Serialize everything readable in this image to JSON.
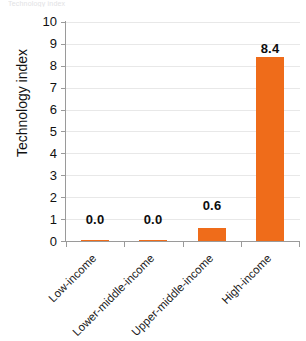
{
  "caption": {
    "text": "Technology index"
  },
  "chart_data": {
    "type": "bar",
    "title": "",
    "xlabel": "",
    "ylabel": "Technology index",
    "categories": [
      "Low-income",
      "Lower-middle-income",
      "Upper-middle-income",
      "High-income"
    ],
    "values": [
      0.0,
      0.0,
      0.6,
      8.4
    ],
    "value_labels": [
      "0.0",
      "0.0",
      "0.6",
      "8.4"
    ],
    "ylim": [
      0,
      10
    ],
    "yticks": [
      0,
      1,
      2,
      3,
      4,
      5,
      6,
      7,
      8,
      9,
      10
    ],
    "ytick_labels": [
      "0",
      "1",
      "2",
      "3",
      "4",
      "5",
      "6",
      "7",
      "8",
      "9",
      "10"
    ],
    "grid": true,
    "legend": false,
    "bar_color": "#ef6c1a",
    "gridline_color": "#e8e8e8",
    "axis_color": "#9a9a9a",
    "label_color": "#0d0d0d"
  }
}
